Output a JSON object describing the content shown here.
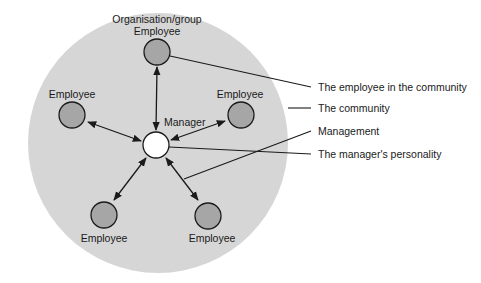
{
  "colors": {
    "community_fill": "#d6d6d6",
    "employee_fill": "#a6a6a6",
    "manager_fill": "#ffffff",
    "stroke": "#1a1a1a"
  },
  "community": {
    "cx": 158,
    "cy": 143,
    "r": 130
  },
  "manager": {
    "label": "Manager",
    "cx": 156,
    "cy": 145,
    "r": 13,
    "label_x": 164,
    "label_y": 126
  },
  "nodes": [
    {
      "id": "top",
      "label": "Employee",
      "group_label": "Organisation/group",
      "cx": 157,
      "cy": 52,
      "r": 13,
      "label_x": 157,
      "label_y": 35,
      "group_y": 23
    },
    {
      "id": "left",
      "label": "Employee",
      "cx": 72,
      "cy": 115,
      "r": 13,
      "label_x": 72,
      "label_y": 98
    },
    {
      "id": "right",
      "label": "Employee",
      "cx": 241,
      "cy": 115,
      "r": 13,
      "label_x": 240,
      "label_y": 98
    },
    {
      "id": "bottom-left",
      "label": "Employee",
      "cx": 104,
      "cy": 215,
      "r": 13,
      "label_x": 104,
      "label_y": 242
    },
    {
      "id": "bottom-right",
      "label": "Employee",
      "cx": 208,
      "cy": 216,
      "r": 13,
      "label_x": 212,
      "label_y": 242
    }
  ],
  "arrows": [
    {
      "from": "manager",
      "to": "top",
      "x1": 156,
      "y1": 130,
      "x2": 157,
      "y2": 67
    },
    {
      "from": "manager",
      "to": "left",
      "x1": 141,
      "y1": 141,
      "x2": 88,
      "y2": 122
    },
    {
      "from": "manager",
      "to": "right",
      "x1": 171,
      "y1": 140,
      "x2": 225,
      "y2": 121
    },
    {
      "from": "manager",
      "to": "bottom-left",
      "x1": 146,
      "y1": 158,
      "x2": 114,
      "y2": 200
    },
    {
      "from": "manager",
      "to": "bottom-right",
      "x1": 166,
      "y1": 158,
      "x2": 198,
      "y2": 200
    }
  ],
  "callouts": [
    {
      "text": "The employee in the community",
      "x1": 170,
      "y1": 56,
      "x2": 311,
      "y2": 87,
      "tx": 318,
      "ty": 91
    },
    {
      "text": "The community",
      "x1": 288,
      "y1": 108,
      "x2": 311,
      "y2": 108,
      "tx": 318,
      "ty": 112
    },
    {
      "text": "Management",
      "x1": 184,
      "y1": 179,
      "x2": 311,
      "y2": 131,
      "tx": 318,
      "ty": 135
    },
    {
      "text": "The manager's personality",
      "x1": 169,
      "y1": 147,
      "x2": 311,
      "y2": 154,
      "tx": 318,
      "ty": 158
    }
  ]
}
